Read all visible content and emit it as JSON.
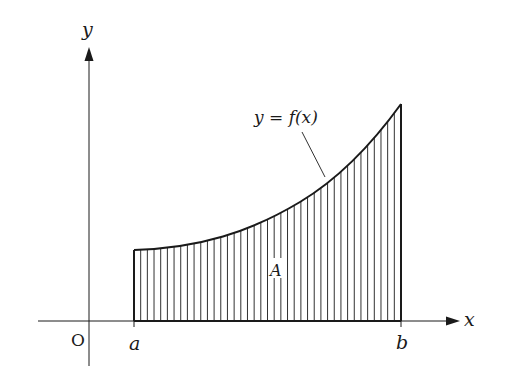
{
  "figure": {
    "type": "area-under-curve diagram",
    "labels": {
      "y_axis": "y",
      "x_axis": "x",
      "origin": "O",
      "lower_bound": "a",
      "upper_bound": "b",
      "area": "A",
      "curve": "y = f(x)"
    },
    "colors": {
      "ink": "#1a1a1a",
      "background": "#ffffff"
    },
    "hatching": "vertical lines",
    "hatch_count": 40
  }
}
